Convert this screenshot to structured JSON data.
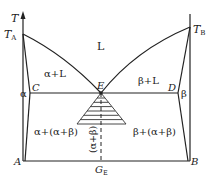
{
  "diagram": {
    "type": "eutectic-phase-diagram",
    "axis": {
      "label": "T"
    },
    "points": {
      "TA": {
        "main": "T",
        "sub": "A"
      },
      "TB": {
        "main": "T",
        "sub": "B"
      },
      "C": "C",
      "D": "D",
      "E": "E",
      "A": "A",
      "B": "B",
      "GE": {
        "main": "G",
        "sub": "E"
      }
    },
    "regions": {
      "liquid": "L",
      "alpha_liquid": "α+L",
      "beta_liquid": "β+L",
      "alpha": "α",
      "beta": "β",
      "alpha_eutectic": "α+(α+β)",
      "beta_eutectic": "β+(α+β)",
      "eutectic": "(α+β)"
    }
  }
}
